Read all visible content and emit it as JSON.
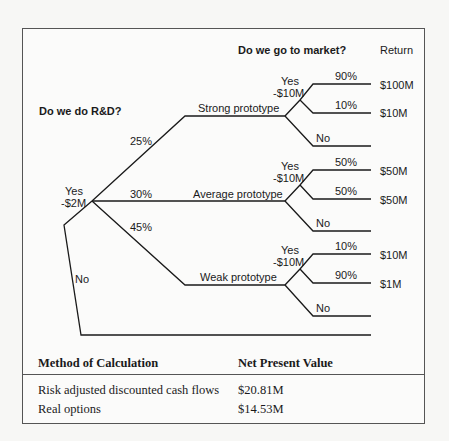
{
  "tree": {
    "question1": "Do we do R&D?",
    "question2": "Do we go to market?",
    "return_header": "Return",
    "root": {
      "yes_label": "Yes",
      "yes_cost": "-$2M",
      "no_label": "No"
    },
    "branches": [
      {
        "name": "Strong prototype",
        "probability": "25%",
        "yes_label": "Yes",
        "yes_cost": "-$10M",
        "outcomes": [
          {
            "probability": "90%",
            "return": "$100M"
          },
          {
            "probability": "10%",
            "return": "$10M"
          }
        ],
        "no_label": "No"
      },
      {
        "name": "Average prototype",
        "probability": "30%",
        "yes_label": "Yes",
        "yes_cost": "-$10M",
        "outcomes": [
          {
            "probability": "50%",
            "return": "$50M"
          },
          {
            "probability": "50%",
            "return": "$50M"
          }
        ],
        "no_label": "No"
      },
      {
        "name": "Weak prototype",
        "probability": "45%",
        "yes_label": "Yes",
        "yes_cost": "-$10M",
        "outcomes": [
          {
            "probability": "10%",
            "return": "$10M"
          },
          {
            "probability": "90%",
            "return": "$1M"
          }
        ],
        "no_label": "No"
      }
    ]
  },
  "table": {
    "headers": [
      "Method of Calculation",
      "Net Present Value"
    ],
    "rows": [
      [
        "Risk adjusted discounted cash flows",
        "$20.81M"
      ],
      [
        "Real options",
        "$14.53M"
      ]
    ]
  },
  "colors": {
    "line": "#1a1a1a",
    "frame": "#555555",
    "background": "#fbfbfa"
  }
}
